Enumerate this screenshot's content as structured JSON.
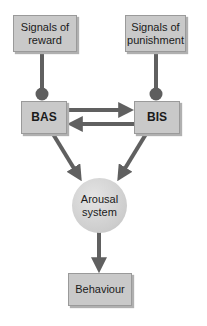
{
  "diagram": {
    "title": "",
    "nodes": {
      "reward": {
        "label_line1": "Signals of",
        "label_line2": "reward"
      },
      "punishment": {
        "label_line1": "Signals of",
        "label_line2": "punishment"
      },
      "bas": {
        "label": "BAS"
      },
      "bis": {
        "label": "BIS"
      },
      "arousal": {
        "label_line1": "Arousal",
        "label_line2": "system"
      },
      "behaviour": {
        "label": "Behaviour"
      }
    },
    "edges": [
      {
        "from": "Signals of reward",
        "to": "BAS",
        "type": "dot-connector"
      },
      {
        "from": "Signals of punishment",
        "to": "BIS",
        "type": "dot-connector"
      },
      {
        "from": "BAS",
        "to": "BIS",
        "type": "arrow"
      },
      {
        "from": "BIS",
        "to": "BAS",
        "type": "arrow"
      },
      {
        "from": "BAS",
        "to": "Arousal system",
        "type": "arrow"
      },
      {
        "from": "BIS",
        "to": "Arousal system",
        "type": "arrow"
      },
      {
        "from": "Arousal system",
        "to": "Behaviour",
        "type": "arrow"
      }
    ],
    "colors": {
      "box_fill": "#c9c9c9",
      "connector": "#606060",
      "circle_fill": "#d2d2d2"
    }
  }
}
